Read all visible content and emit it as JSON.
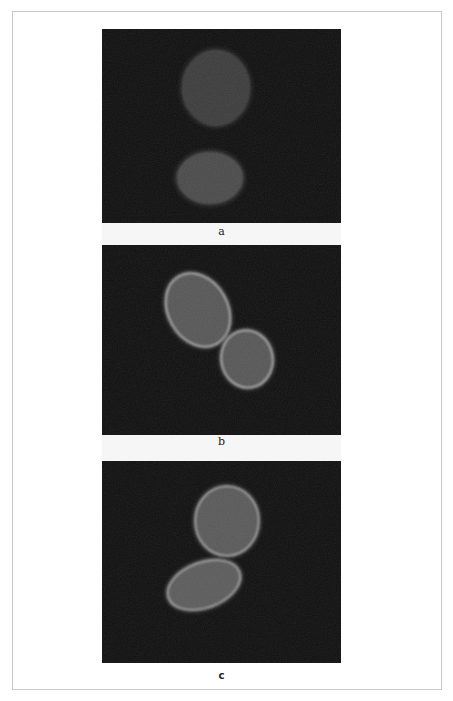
{
  "figure": {
    "panels": [
      {
        "id": "a",
        "label": "a",
        "description": "Two cells with dim, diffuse fluorescence",
        "cells": [
          {
            "cx": 114,
            "cy": 59,
            "rx": 34,
            "ry": 38,
            "rotate": 0,
            "fill": "#3a3a3a",
            "rim": "#454545"
          },
          {
            "cx": 108,
            "cy": 149,
            "rx": 33,
            "ry": 26,
            "rotate": 0,
            "fill": "#4a4a4a",
            "rim": "#4f4f4f"
          }
        ]
      },
      {
        "id": "b",
        "label": "b",
        "description": "Two oval cells with bright membrane rim fluorescence",
        "cells": [
          {
            "cx": 96,
            "cy": 65,
            "rx": 30,
            "ry": 39,
            "rotate": -30,
            "fill": "#555555",
            "rim": "#a8a8a8"
          },
          {
            "cx": 145,
            "cy": 114,
            "rx": 26,
            "ry": 29,
            "rotate": -10,
            "fill": "#555555",
            "rim": "#a8a8a8"
          }
        ]
      },
      {
        "id": "c",
        "label": "c",
        "description": "Two touching cells with bright rim fluorescence",
        "cells": [
          {
            "cx": 125,
            "cy": 60,
            "rx": 32,
            "ry": 35,
            "rotate": 0,
            "fill": "#585858",
            "rim": "#9a9a9a"
          },
          {
            "cx": 102,
            "cy": 124,
            "rx": 38,
            "ry": 23,
            "rotate": -20,
            "fill": "#5a5a5a",
            "rim": "#a0a0a0"
          }
        ]
      }
    ],
    "colors": {
      "panel_background": "#0e0e0e",
      "frame_border": "#c8c8c8",
      "page_background": "#ffffff"
    }
  }
}
